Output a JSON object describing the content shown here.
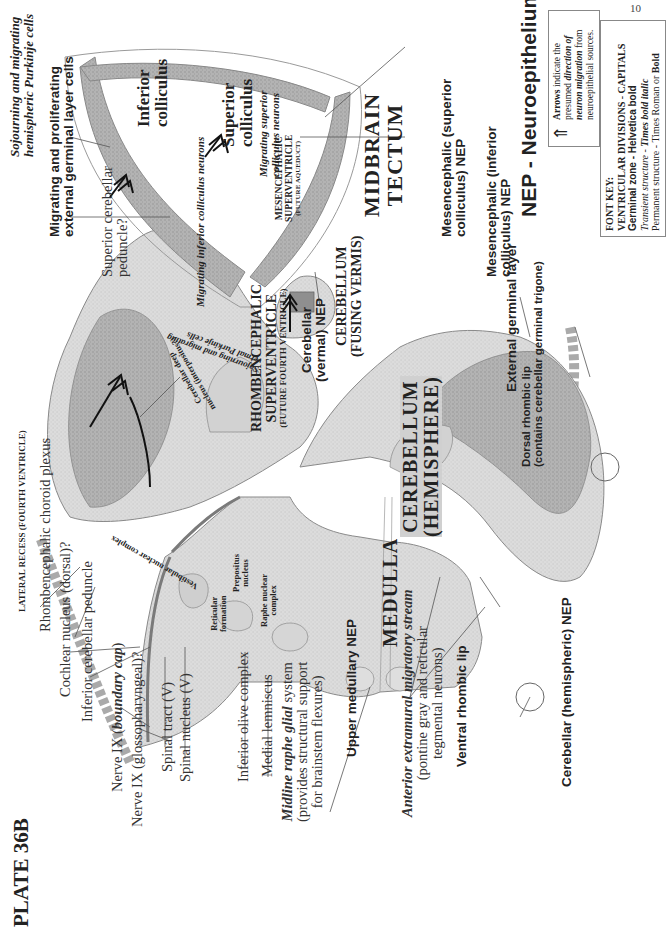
{
  "page": {
    "number": "10",
    "plate_title": "PLATE 36B"
  },
  "divisions": {
    "medulla": "MEDULLA",
    "cerebellum_hemisphere_1": "CEREBELLUM",
    "cerebellum_hemisphere_2": "(HEMISPHERE)",
    "cerebellum_vermis_1": "CEREBELLUM",
    "cerebellum_vermis_2": "(FUSING VERMIS)",
    "midbrain_tectum_1": "MIDBRAIN",
    "midbrain_tectum_2": "TECTUM",
    "rhombencephalic_sv_1": "RHOMBENCEPHALIC",
    "rhombencephalic_sv_2": "SUPERVENTRICLE",
    "rhombencephalic_sv_3": "(FUTURE FOURTH VENTRICLE)",
    "mesencephalic_sv_1": "MESENCEPHALIC",
    "mesencephalic_sv_2": "SUPERVENTRICLE",
    "mesencephalic_sv_3": "(FUTURE AQUEDUCT)",
    "lateral_recess": "LATERAL RECESS (FOURTH VENTRICLE)"
  },
  "permanent_labels": {
    "rhombencephalic_choroid_plexus": "Rhombencephalic choroid plexus",
    "cochlear_nucleus": "Cochlear nucleus (dorsal)?",
    "inferior_cerebellar_peduncle": "Inferior cerebellar peduncle",
    "nerve_ix_boundary_prefix": "Nerve IX (",
    "nerve_ix_boundary_italic": "boundary cap",
    "nerve_ix_boundary_suffix": ")",
    "nerve_ix_glosso": "Nerve IX (glossopharyngeal)?",
    "spinal_tract": "Spinal tract (V)",
    "spinal_nucleus": "Spinal nucleus (V)",
    "inferior_olive": "Inferior olive complex",
    "medial_lemniscus": "Medial lemniscus",
    "midline_raphe_italic": "Midline raphe glial",
    "midline_raphe_rest": " system",
    "midline_raphe_line2": "(provides structural support",
    "midline_raphe_line3": "for brainstem flexures)",
    "anterior_stream_italic": "Anterior extramural migratory stream",
    "anterior_stream_line2": "(pontine gray and reticular",
    "anterior_stream_line3": "tegmental neurons)",
    "superior_cerebellar_peduncle_1": "Superior cerebellar",
    "superior_cerebellar_peduncle_2": "peduncle?",
    "inferior_colliculus_1": "Inferior",
    "inferior_colliculus_2": "colliculus",
    "superior_colliculus_1": "Superior",
    "superior_colliculus_2": "colliculus"
  },
  "inner_labels": {
    "vestibular": "Vestibular nuclear complex",
    "reticular_1": "Reticular",
    "reticular_2": "formation",
    "prepositus_1": "Prepositus",
    "prepositus_2": "nucleus",
    "raphe_1": "Raphe nuclear",
    "raphe_2": "complex",
    "deep_nucleus_1": "Cerebellar deep",
    "deep_nucleus_2": "nucleus (interpositus?)"
  },
  "germinal_labels": {
    "upper_medullary_nep": "Upper medullary NEP",
    "ventral_rhombic_lip": "Ventral rhombic lip",
    "cerebellar_hemispheric_nep": "Cerebellar (hemispheric) NEP",
    "cerebellar_vermal_nep_1": "Cerebellar",
    "cerebellar_vermal_nep_2": "(vermal) NEP",
    "external_germinal_layer": "External germinal layer",
    "dorsal_rhombic_lip_1": "Dorsal rhombic lip",
    "dorsal_rhombic_lip_2": "(contains cerebellar germinal trigone)",
    "mes_inferior_nep_1": "Mesencephalic (inferior",
    "mes_inferior_nep_2": "colliculus) NEP",
    "mes_superior_nep_1": "Mesencephalic (superior",
    "mes_superior_nep_2": "colliculus) NEP",
    "migrating_egl_1": "Migrating and proliferating",
    "migrating_egl_2": "external germinal layer cells"
  },
  "transient_labels": {
    "hemispheric_purkinje_1": "Sojourning and migrating",
    "hemispheric_purkinje_2": "hemispheric Purkinje cells",
    "vermal_purkinje_1": "Sojourning and migrating",
    "vermal_purkinje_2": "vermal Purkinje cells",
    "migrating_inferior": "Migrating inferior colliculus neurons",
    "migrating_superior_1": "Migrating superior",
    "migrating_superior_2": "colliculus neurons"
  },
  "legend": {
    "nep_title": "NEP - Neuroepithelium",
    "arrow_icon": "double-chevron-arrow",
    "arrows_bold": "Arrows",
    "arrows_text_1": " indicate the",
    "arrows_text_2a": "presumed ",
    "arrows_text_2b": "direction of",
    "arrows_text_3a": "neuron migration",
    "arrows_text_3b": " from",
    "arrows_text_4": "neuroepithelial sources.",
    "font_key_title": "FONT KEY:",
    "font_key_divisions": "VENTRICULAR DIVISIONS - CAPITALS",
    "font_key_germinal": "Germinal zone - Helvetica bold",
    "font_key_transient_a": "Transient structure",
    "font_key_transient_b": " - ",
    "font_key_transient_c": "Times bold italic",
    "font_key_permanent_a": "Permanent structure - Times Roman or ",
    "font_key_permanent_b": "Bold"
  },
  "colors": {
    "tissue_light": "#e3e3e3",
    "tissue_mid": "#c9c9c9",
    "tissue_dark": "#9a9a9a",
    "outline": "#8a8a8a",
    "leader": "#555555",
    "text": "#222222"
  }
}
